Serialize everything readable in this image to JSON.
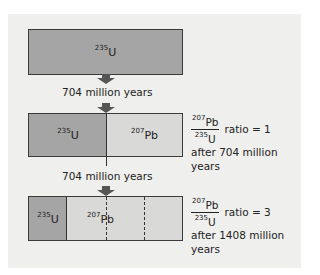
{
  "diagram": {
    "isotopes": {
      "parent": {
        "mass": "235",
        "symbol": "U"
      },
      "daughter": {
        "mass": "207",
        "symbol": "Pb"
      }
    },
    "colors": {
      "panel_bg": "#efefed",
      "uranium_fill": "#a5a5a5",
      "lead_fill": "#d9d9d7",
      "arrow": "#555555",
      "outline": "#3a3a3a"
    },
    "stages": [
      {
        "label": "235U",
        "segments": [
          {
            "isotope": "235U",
            "fraction": 1.0
          }
        ]
      },
      {
        "label": "after 704 million years",
        "segments": [
          {
            "isotope": "235U",
            "fraction": 0.5
          },
          {
            "isotope": "207Pb",
            "fraction": 0.5
          }
        ],
        "ratio": "1"
      },
      {
        "label": "after 1408 million years",
        "segments": [
          {
            "isotope": "235U",
            "fraction": 0.25
          },
          {
            "isotope": "207Pb",
            "fraction": 0.75
          }
        ],
        "ratio": "3"
      }
    ],
    "interval_1": "704 million years",
    "interval_2": "704 million years",
    "ratio_1": {
      "text": "ratio = 1",
      "after": "after 704 million",
      "after2": "years"
    },
    "ratio_2": {
      "text": "ratio = 3",
      "after": "after 1408 million",
      "after2": "years"
    }
  }
}
